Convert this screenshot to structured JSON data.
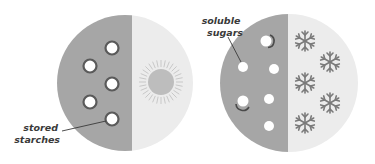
{
  "colors": {
    "dark_half": "#a6a6a6",
    "light_half": "#ececec",
    "granule_ring": "#5a5a5a",
    "granule_fill": "#ffffff",
    "sun": "#bdbdbd",
    "snowflake": "#7a7a7a",
    "label": "#3a3a3a",
    "leader": "#3a3a3a"
  },
  "panels": [
    {
      "name": "warm-leaf",
      "center": [
        125,
        83
      ],
      "radius": 68,
      "light_symbol": "sun-icon",
      "label": {
        "lines": [
          "stored",
          "starches"
        ]
      }
    },
    {
      "name": "cold-leaf",
      "center": [
        289,
        83
      ],
      "radius": 69,
      "light_symbol": "snowflake-icon",
      "label": {
        "lines": [
          "soluble",
          "sugars"
        ]
      }
    }
  ]
}
